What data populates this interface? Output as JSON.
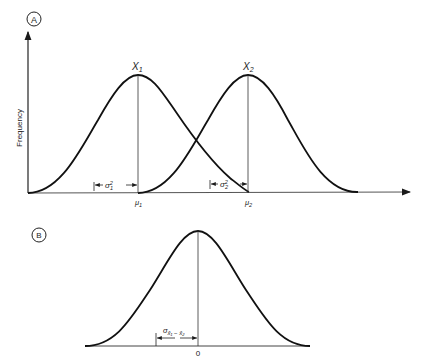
{
  "panel_a": {
    "label": "A",
    "y_axis_label": "Frequency",
    "curve1_label": "X",
    "curve1_sub": "1",
    "curve2_label": "X",
    "curve2_sub": "2",
    "mean1": "μ",
    "mean1_sub": "1",
    "mean2": "μ",
    "mean2_sub": "2",
    "sigma1": "σ",
    "sigma1_sup": "2",
    "sigma1_sub": "1",
    "sigma2": "σ",
    "sigma2_sup": "2",
    "sigma2_sub": "2"
  },
  "panel_b": {
    "label": "B",
    "center_tick": "0",
    "sigma_label": "σ",
    "sigma_sub": "x̄₁ − x̄₂"
  },
  "colors": {
    "ink": "#1a1a1a",
    "axis": "#333333"
  }
}
